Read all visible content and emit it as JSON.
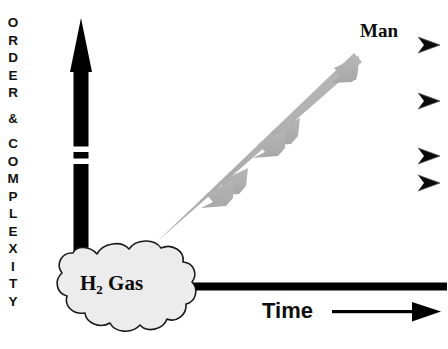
{
  "figure": {
    "background_color": "#ffffff",
    "width": 448,
    "height": 349
  },
  "axes": {
    "vertical": {
      "label_text": "ORDER & COMPLEXITY",
      "letters": [
        "O",
        "R",
        "D",
        "E",
        "R",
        " ",
        "&",
        " ",
        "C",
        "O",
        "M",
        "P",
        "L",
        "E",
        "X",
        "I",
        "T",
        "Y"
      ],
      "arrow_color": "#000000",
      "direction": "up",
      "has_break": true,
      "break_count": 2
    },
    "horizontal": {
      "label": "Time",
      "arrow_color": "#000000",
      "direction": "right"
    }
  },
  "cloud": {
    "label_main": "H",
    "label_sub": "2",
    "label_tail": "Gas",
    "fill_color": "#ececec",
    "stroke_color": "#1a1a1a"
  },
  "trend_arrow": {
    "name": "evolution-arrow",
    "color": "#b0b0b0",
    "from_label": "H2 Gas",
    "to_label": "Man",
    "barb_count": 2
  },
  "top_label": {
    "text": "Man"
  },
  "right_markers": {
    "count": 4,
    "glyph": "arrowhead-right",
    "color": "#000000"
  }
}
